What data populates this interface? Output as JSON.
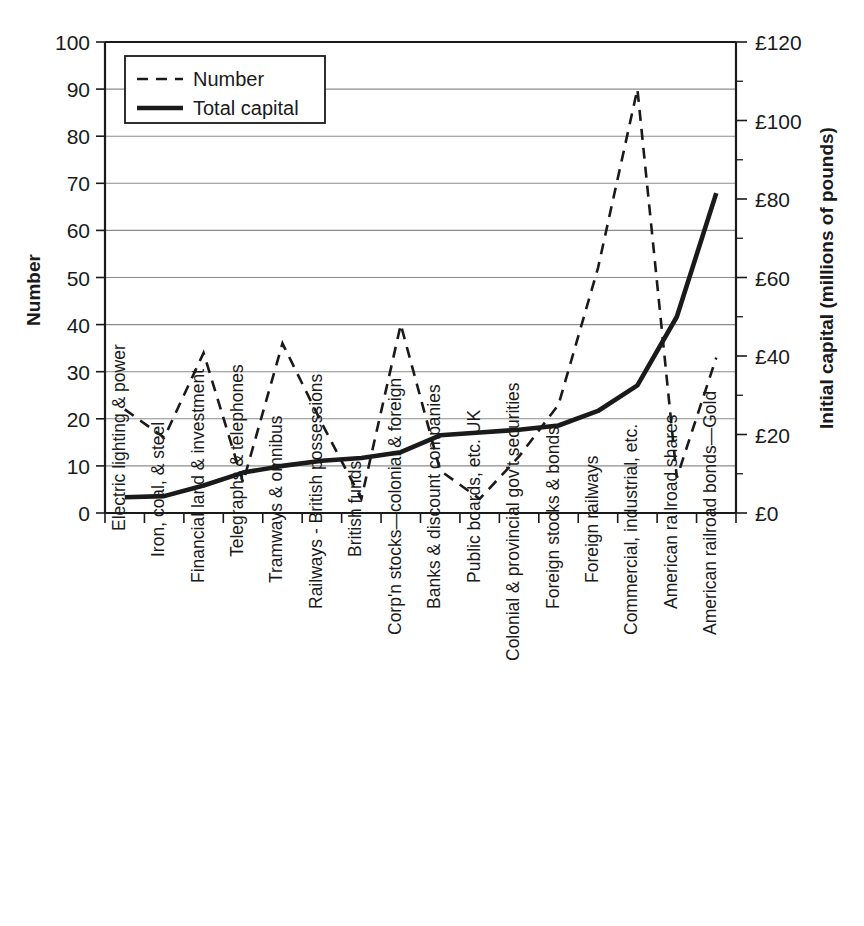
{
  "chart_data": {
    "type": "line",
    "title": "",
    "subtitle": "",
    "xlabel": "",
    "ylabel": "Number",
    "y2label": "Initial capital (millions of pounds)",
    "ylim": [
      0,
      100
    ],
    "y2lim": [
      0,
      120
    ],
    "grid": true,
    "legend_position": "top-left",
    "categories": [
      "Electric lighting & power",
      "Iron, coal, & steel",
      "Financial land & investment",
      "Telegraphs & telephones",
      "Tramways & omnibus",
      "Railways - British possessions",
      "British funds",
      "Corp'n stocks—colonial & foreign",
      "Banks & discount companies",
      "Public boards, etc. UK",
      "Colonial & provincial gov't securities",
      "Foreign stocks & bonds",
      "Foreign railways",
      "Commercial, industrial, etc.",
      "American railroad shares",
      "American railroad bonds—Gold"
    ],
    "series": [
      {
        "name": "Number",
        "axis": "left",
        "style": "dashed",
        "values": [
          22,
          16,
          34,
          6.5,
          36,
          19,
          3,
          40,
          9,
          3,
          12,
          23,
          52,
          90,
          7.5,
          33
        ]
      },
      {
        "name": "Total capital",
        "axis": "right",
        "style": "solid",
        "values": [
          4,
          4.3,
          7,
          10.3,
          12,
          13.3,
          14,
          15.5,
          19.8,
          20.5,
          21.2,
          22.3,
          26,
          32.5,
          50,
          81.5
        ]
      }
    ],
    "y_ticks_left": [
      "0",
      "10",
      "20",
      "30",
      "40",
      "50",
      "60",
      "70",
      "80",
      "90",
      "100"
    ],
    "y_ticks_right": [
      "£0",
      "£20",
      "£40",
      "£60",
      "£80",
      "£100",
      "£120"
    ],
    "y_ticks_right_values": [
      0,
      20,
      40,
      60,
      80,
      100,
      120
    ],
    "y_minor_ticks_right_values": [
      10,
      30,
      50,
      70,
      90,
      110
    ]
  },
  "legend": {
    "items": [
      {
        "label": "Number",
        "style": "dashed"
      },
      {
        "label": "Total capital",
        "style": "solid"
      }
    ]
  }
}
